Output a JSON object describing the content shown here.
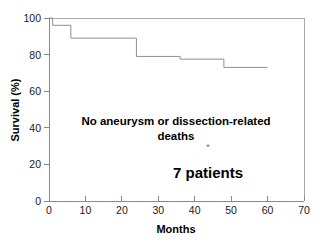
{
  "chart_data": {
    "type": "line",
    "title": "",
    "subtitle": "",
    "xlabel": "Months",
    "ylabel": "Survival (%)",
    "xlim": [
      0,
      70
    ],
    "ylim": [
      0,
      100
    ],
    "xticks": [
      0,
      10,
      20,
      30,
      40,
      50,
      60,
      70
    ],
    "yticks": [
      0,
      20,
      40,
      60,
      80,
      100
    ],
    "xtick_labels": [
      "0",
      "10",
      "20",
      "30",
      "40",
      "50",
      "60",
      "70"
    ],
    "ytick_labels": [
      "0",
      "20",
      "40",
      "60",
      "80",
      "100"
    ],
    "grid": false,
    "legend": false,
    "legend_position": "none",
    "series": [
      {
        "name": "Survival",
        "step": "post",
        "x": [
          0,
          1,
          6,
          24,
          36,
          48,
          60
        ],
        "y": [
          100,
          96,
          89,
          79,
          77.5,
          73,
          73
        ]
      }
    ],
    "annotations": [
      {
        "name": "no-deaths-note",
        "text_line1": "No aneurysm or dissection-related",
        "text_line2": "deaths",
        "x": 24,
        "y": 44
      },
      {
        "name": "asterisk-marker",
        "text": "*",
        "x": 45,
        "y": 29
      },
      {
        "name": "patient-count",
        "text": "7 patients",
        "x": 45,
        "y": 18
      }
    ]
  },
  "axes": {
    "x_title": "Months",
    "y_title": "Survival (%)"
  },
  "colors": {
    "curve": "#8f8f8f",
    "axis": "#8a8a8a",
    "frame": "#a8a8a8",
    "text": "#000000",
    "tick_text": "#1a1a1a",
    "background": "#ffffff"
  }
}
